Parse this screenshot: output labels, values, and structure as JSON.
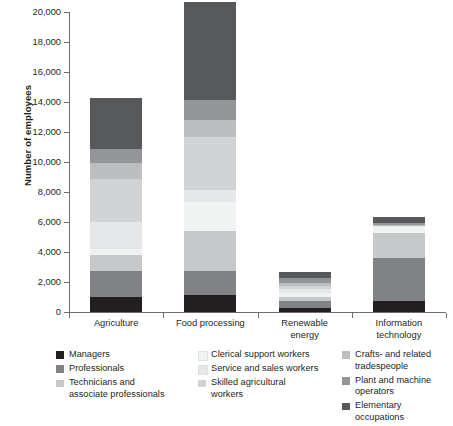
{
  "chart_data": {
    "type": "bar",
    "subtype": "stacked-vertical",
    "title": "",
    "xlabel": "",
    "ylabel": "Number of employees",
    "ylim": [
      0,
      20000
    ],
    "ytick_step": 2000,
    "yticks": [
      "0",
      "2,000",
      "4,000",
      "6,000",
      "8,000",
      "10,000",
      "12,000",
      "14,000",
      "16,000",
      "18,000",
      "20,000"
    ],
    "grid": false,
    "legend_position": "bottom",
    "categories": [
      "Agriculture",
      "Food processing",
      "Renewable energy",
      "Information technology"
    ],
    "category_labels_wrapped": [
      [
        "Agriculture"
      ],
      [
        "Food processing"
      ],
      [
        "Renewable",
        "energy"
      ],
      [
        "Information",
        "technology"
      ]
    ],
    "series": [
      {
        "name": "Managers",
        "color": "#231f20",
        "values": [
          1000,
          1100,
          250,
          700
        ]
      },
      {
        "name": "Professionals",
        "color": "#808285",
        "values": [
          1700,
          1600,
          450,
          2900
        ]
      },
      {
        "name": "Technicians and associate professionals",
        "color": "#c7c8ca",
        "values": [
          1050,
          2700,
          250,
          1650
        ]
      },
      {
        "name": "Clerical support workers",
        "color": "#f1f2f2",
        "values": [
          450,
          1900,
          300,
          400
        ]
      },
      {
        "name": "Service and sales workers",
        "color": "#e6e7e8",
        "values": [
          1800,
          850,
          250,
          50
        ]
      },
      {
        "name": "Skilled agricultural workers",
        "color": "#d1d3d4",
        "values": [
          2850,
          3500,
          200,
          50
        ]
      },
      {
        "name": "Crafts- and related tradespeople",
        "color": "#bcbec0",
        "values": [
          1100,
          1150,
          200,
          50
        ]
      },
      {
        "name": "Plant and machine operators",
        "color": "#939598",
        "values": [
          900,
          1350,
          350,
          100
        ]
      },
      {
        "name": "Elementary occupations",
        "color": "#58595b",
        "values": [
          3400,
          6500,
          400,
          450
        ]
      }
    ],
    "totals": [
      14250,
      20650,
      2650,
      6350
    ]
  },
  "legend": {
    "columns": [
      [
        {
          "label": "Managers",
          "color": "#231f20"
        },
        {
          "label": "Professionals",
          "color": "#808285"
        },
        {
          "label": "Technicians and\nassociate professionals",
          "color": "#c7c8ca"
        }
      ],
      [
        {
          "label": "Clerical support workers",
          "color": "#f1f2f2"
        },
        {
          "label": "Service and sales workers",
          "color": "#e6e7e8"
        },
        {
          "label": "Skilled agricultural\nworkers",
          "color": "#d1d3d4"
        }
      ],
      [
        {
          "label": "Crafts- and related\ntradespeople",
          "color": "#bcbec0"
        },
        {
          "label": "Plant and machine operators",
          "color": "#939598"
        },
        {
          "label": "Elementary occupations",
          "color": "#58595b"
        }
      ]
    ]
  },
  "colors": {
    "axis": "#6d6e71",
    "text": "#231f20",
    "background": "#ffffff"
  }
}
